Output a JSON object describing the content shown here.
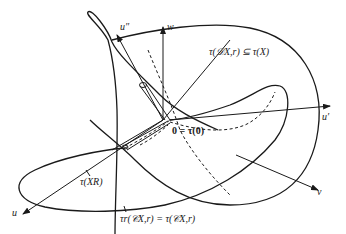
{
  "figure": {
    "axes": {
      "u": "u",
      "v": "v",
      "w": "w",
      "u_prime": "u′",
      "u_double_prime": "u″"
    },
    "labels": {
      "origin": "0 = τ(0)",
      "D_image": "τ(𝒟X,r) ⊆ τ(X)",
      "X_R_image": "τ(XR)",
      "C_image": "τr(𝒞X,r) = τ(𝒞X,r)"
    },
    "label_parts": {
      "origin_bold": "0",
      "origin_rest": " = τ(",
      "origin_bold2": "0",
      "origin_close": ")",
      "d_tau": "τ(",
      "d_script": "𝒟",
      "d_sub": "X, r",
      "d_rest": ")⊆τ(X)",
      "xr_tau": "τ(X",
      "xr_sub": "R",
      "xr_close": ")",
      "c_tau": "τ",
      "c_sub_r": "r",
      "c_open": "(𝒞",
      "c_sub1": "X, r",
      "c_mid": ")=τ(𝒞",
      "c_sub2": "X, r",
      "c_close": ")"
    }
  }
}
